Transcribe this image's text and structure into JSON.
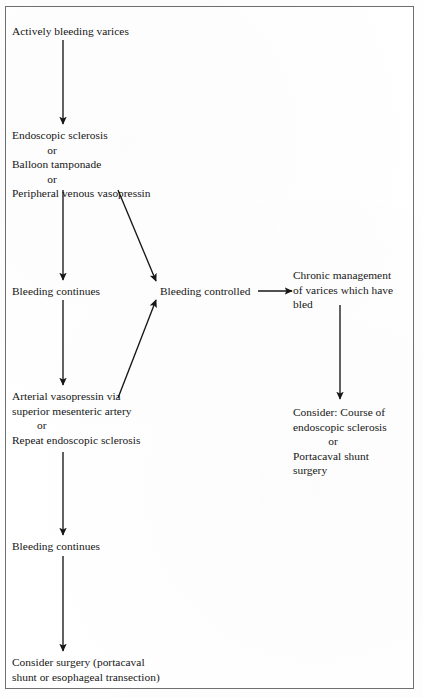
{
  "figure": {
    "type": "flowchart",
    "title_visible": false,
    "frame": {
      "border_color": "#6f6f6f",
      "background": "#ffffff"
    },
    "text_color": "#161616"
  },
  "nodes": [
    {
      "id": "actively-bleeding-varices",
      "name": "node-actively-bleeding-varices",
      "lines": [
        "Actively bleeding varices"
      ],
      "x": 12,
      "y": 24
    },
    {
      "id": "initial-therapy",
      "name": "node-initial-therapy",
      "lines": [
        "Endoscopic sclerosis",
        "or",
        "Balloon tamponade",
        "or",
        "Peripheral venous vasopressin"
      ],
      "or_indices": [
        1,
        3
      ],
      "x": 12,
      "y": 128
    },
    {
      "id": "bleeding-continues-1",
      "name": "node-bleeding-continues-first",
      "lines": [
        "Bleeding continues"
      ],
      "x": 12,
      "y": 284
    },
    {
      "id": "bleeding-controlled",
      "name": "node-bleeding-controlled",
      "lines": [
        "Bleeding controlled"
      ],
      "x": 160,
      "y": 284
    },
    {
      "id": "chronic-management",
      "name": "node-chronic-management",
      "lines": [
        "Chronic management",
        "of varices which have",
        "bled"
      ],
      "x": 293,
      "y": 268
    },
    {
      "id": "salvage-therapy",
      "name": "node-salvage-therapy",
      "lines": [
        "Arterial vasopressin via",
        "superior mesenteric artery",
        "or",
        "Repeat endoscopic sclerosis"
      ],
      "or_indices": [
        2
      ],
      "x": 12,
      "y": 389
    },
    {
      "id": "consider-course",
      "name": "node-consider-course",
      "lines": [
        "Consider: Course of",
        "endoscopic sclerosis",
        "or",
        "Portacaval shunt",
        "surgery"
      ],
      "or_indices": [
        2
      ],
      "x": 293,
      "y": 405
    },
    {
      "id": "bleeding-continues-2",
      "name": "node-bleeding-continues-second",
      "lines": [
        "Bleeding continues"
      ],
      "x": 12,
      "y": 539
    },
    {
      "id": "consider-surgery",
      "name": "node-consider-surgery",
      "lines": [
        "Consider surgery (portacaval",
        "shunt or esophageal transection)"
      ],
      "x": 12,
      "y": 655
    }
  ],
  "edges": [
    {
      "id": "e1",
      "name": "arrow-varices-to-initial-therapy",
      "from": "actively-bleeding-varices",
      "to": "initial-therapy",
      "kind": "vertical",
      "x1": 63,
      "y1": 40,
      "x2": 63,
      "y2": 124
    },
    {
      "id": "e2",
      "name": "arrow-initial-therapy-to-bleeding-continues",
      "from": "initial-therapy",
      "to": "bleeding-continues-1",
      "kind": "vertical",
      "x1": 63,
      "y1": 190,
      "x2": 63,
      "y2": 280
    },
    {
      "id": "e3",
      "name": "arrow-initial-therapy-to-bleeding-controlled",
      "from": "initial-therapy",
      "to": "bleeding-controlled",
      "kind": "diagonal",
      "x1": 118,
      "y1": 190,
      "x2": 156,
      "y2": 281
    },
    {
      "id": "e4",
      "name": "arrow-bleeding-controlled-to-chronic-management",
      "from": "bleeding-controlled",
      "to": "chronic-management",
      "kind": "horizontal",
      "x1": 258,
      "y1": 291,
      "x2": 292,
      "y2": 291
    },
    {
      "id": "e5",
      "name": "arrow-bleeding-continues-to-salvage-therapy",
      "from": "bleeding-continues-1",
      "to": "salvage-therapy",
      "kind": "vertical",
      "x1": 63,
      "y1": 300,
      "x2": 63,
      "y2": 385
    },
    {
      "id": "e6",
      "name": "arrow-salvage-therapy-to-bleeding-controlled",
      "from": "salvage-therapy",
      "to": "bleeding-controlled",
      "kind": "diagonal",
      "x1": 118,
      "y1": 398,
      "x2": 156,
      "y2": 300
    },
    {
      "id": "e7",
      "name": "arrow-chronic-management-to-consider-course",
      "from": "chronic-management",
      "to": "consider-course",
      "kind": "vertical",
      "x1": 340,
      "y1": 305,
      "x2": 340,
      "y2": 399
    },
    {
      "id": "e8",
      "name": "arrow-salvage-therapy-to-bleeding-continues-2",
      "from": "salvage-therapy",
      "to": "bleeding-continues-2",
      "kind": "vertical",
      "x1": 63,
      "y1": 452,
      "x2": 63,
      "y2": 535
    },
    {
      "id": "e9",
      "name": "arrow-bleeding-continues-2-to-consider-surgery",
      "from": "bleeding-continues-2",
      "to": "consider-surgery",
      "kind": "vertical",
      "x1": 63,
      "y1": 556,
      "x2": 63,
      "y2": 651
    }
  ]
}
